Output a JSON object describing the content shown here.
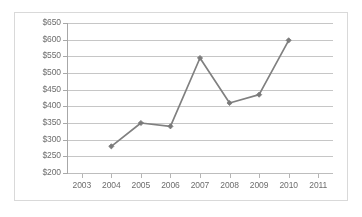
{
  "chart_data": {
    "type": "line",
    "title": "",
    "xlabel": "",
    "ylabel": "",
    "categories": [
      "2003",
      "2004",
      "2005",
      "2006",
      "2007",
      "2008",
      "2009",
      "2010",
      "2011"
    ],
    "x": [
      2003,
      2004,
      2005,
      2006,
      2007,
      2008,
      2009,
      2010,
      2011
    ],
    "values": [
      null,
      280,
      350,
      340,
      545,
      410,
      435,
      598,
      null
    ],
    "series": [
      {
        "name": "",
        "points": [
          {
            "x": "2004",
            "y": 280
          },
          {
            "x": "2005",
            "y": 350
          },
          {
            "x": "2006",
            "y": 340
          },
          {
            "x": "2007",
            "y": 545
          },
          {
            "x": "2008",
            "y": 410
          },
          {
            "x": "2009",
            "y": 435
          },
          {
            "x": "2010",
            "y": 598
          }
        ]
      }
    ],
    "ylim": [
      200,
      650
    ],
    "ytick_labels": [
      "$650",
      "$600",
      "$550",
      "$500",
      "$450",
      "$400",
      "$350",
      "$300",
      "$250",
      "$200"
    ],
    "ytick_values": [
      650,
      600,
      550,
      500,
      450,
      400,
      350,
      300,
      250,
      200
    ],
    "ytick_step": 50,
    "xtick_labels": [
      "2003",
      "2004",
      "2005",
      "2006",
      "2007",
      "2008",
      "2009",
      "2010",
      "2011"
    ],
    "grid": "horizontal",
    "legend": "none",
    "line_color": "#808080",
    "marker_color": "#7a7a7a",
    "marker_shape": "diamond",
    "gridline_color": "#c6c6c6",
    "axis_color": "#a8a8a8",
    "text_color": "#6d6d6d",
    "background": "#ffffff",
    "border_color": "#d9d9d9"
  }
}
